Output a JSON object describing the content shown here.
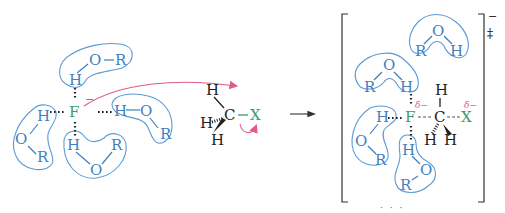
{
  "diagram": {
    "reactant": {
      "nucleophile": {
        "atom": "F",
        "charge": "−",
        "color": "#3a9a6a"
      },
      "solvent_molecules": [
        {
          "atoms": [
            "H",
            "O",
            "R"
          ],
          "position": "top"
        },
        {
          "atoms": [
            "H",
            "O",
            "R"
          ],
          "position": "left"
        },
        {
          "atoms": [
            "H",
            "O",
            "R"
          ],
          "position": "bottom"
        },
        {
          "atoms": [
            "H",
            "O",
            "R"
          ],
          "position": "right"
        }
      ],
      "substrate": {
        "carbon": "C",
        "hydrogens": [
          "H",
          "H",
          "H"
        ],
        "leaving_group": "X"
      }
    },
    "arrow_label": "→",
    "transition_state": {
      "nucleophile": "F",
      "carbon": "C",
      "leaving_group": "X",
      "partial_charge_f": "δ−",
      "partial_charge_x": "δ−",
      "hydrogens": [
        "H",
        "H",
        "H"
      ],
      "solvent_molecules": [
        {
          "atoms": [
            "R",
            "O",
            "H"
          ],
          "position": "top-right-free"
        },
        {
          "atoms": [
            "R",
            "O",
            "H"
          ],
          "position": "top"
        },
        {
          "atoms": [
            "H",
            "O",
            "R"
          ],
          "position": "left"
        },
        {
          "atoms": [
            "H",
            "O",
            "R"
          ],
          "position": "bottom"
        }
      ],
      "bracket_charge": "−",
      "double_dagger": "‡"
    },
    "colors": {
      "solvent": "#3f7fbf",
      "nucleophile": "#3a9a6a",
      "curved_arrow": "#e05a8a",
      "shell": "#5a9ad6"
    },
    "labels": {
      "H": "H",
      "O": "O",
      "R": "R",
      "F": "F",
      "C": "C",
      "X": "X",
      "minus": "−",
      "ddagger": "‡",
      "delta_minus": "δ−"
    },
    "caption_partial": "· · ·"
  }
}
